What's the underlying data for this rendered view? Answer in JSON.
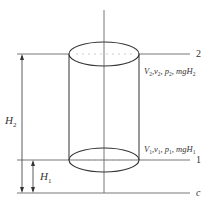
{
  "diagram": {
    "title_fragment": "",
    "levels": {
      "top": {
        "label": "2",
        "vars": [
          "V",
          "v",
          "p",
          "mgH"
        ],
        "subscript": "2"
      },
      "bottom": {
        "label": "1",
        "vars": [
          "V",
          "v",
          "p",
          "mgH"
        ],
        "subscript": "1"
      },
      "datum": {
        "label": "c"
      }
    },
    "heights": {
      "H2": {
        "symbol": "H",
        "subscript": "2"
      },
      "H1": {
        "symbol": "H",
        "subscript": "1"
      }
    },
    "colors": {
      "line": "#333333",
      "dashed": "#999999"
    }
  }
}
